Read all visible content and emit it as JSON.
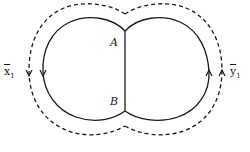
{
  "diagram": {
    "type": "two-lobed contour figure",
    "labels": {
      "point_a": "A",
      "point_b": "B",
      "left_path": {
        "base": "x",
        "subscript": "1",
        "overline": true
      },
      "right_path": {
        "base": "y",
        "subscript": "1",
        "overline": true
      }
    },
    "colors": {
      "stroke": "#1a1a1a",
      "background": "#ffffff"
    },
    "elements": [
      {
        "id": "left-solid-arc",
        "style": "solid",
        "direction": "down on left side"
      },
      {
        "id": "right-solid-arc",
        "style": "solid",
        "direction": "up on right side"
      },
      {
        "id": "center-chord",
        "style": "solid",
        "from": "A",
        "to": "B"
      },
      {
        "id": "outer-dashed-contour",
        "style": "dashed",
        "direction": "down on left, up on right"
      }
    ]
  }
}
